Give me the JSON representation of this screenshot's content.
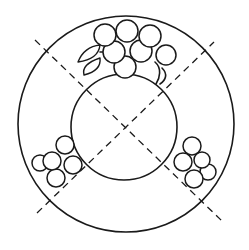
{
  "diagram": {
    "colors": {
      "line": "#1a1a1a",
      "background": "#ffffff"
    },
    "outer_circle": {
      "cx": 126,
      "cy": 124,
      "r": 108
    },
    "inner_circle": {
      "cx": 124,
      "cy": 127,
      "r": 53
    },
    "guide_lines": [
      {
        "x1": 35,
        "y1": 40,
        "x2": 222,
        "y2": 221
      },
      {
        "x1": 37,
        "y1": 213,
        "x2": 214,
        "y2": 42
      }
    ],
    "clusters": [
      {
        "name": "top-grape-cluster",
        "grapes": [
          {
            "cx": 105,
            "cy": 35,
            "r": 11
          },
          {
            "cx": 127,
            "cy": 31,
            "r": 11
          },
          {
            "cx": 150,
            "cy": 36,
            "r": 11
          },
          {
            "cx": 114,
            "cy": 53,
            "r": 11
          },
          {
            "cx": 139,
            "cy": 52,
            "r": 11
          },
          {
            "cx": 166,
            "cy": 55,
            "r": 10
          },
          {
            "cx": 125,
            "cy": 68,
            "r": 11
          }
        ],
        "leaves": 2
      },
      {
        "name": "left-grape-cluster",
        "grapes": [
          {
            "cx": 65,
            "cy": 145,
            "r": 9
          },
          {
            "cx": 40,
            "cy": 163,
            "r": 8
          },
          {
            "cx": 52,
            "cy": 162,
            "r": 9
          },
          {
            "cx": 73,
            "cy": 165,
            "r": 9
          },
          {
            "cx": 55,
            "cy": 178,
            "r": 9
          }
        ]
      },
      {
        "name": "right-grape-cluster",
        "grapes": [
          {
            "cx": 192,
            "cy": 146,
            "r": 9
          },
          {
            "cx": 202,
            "cy": 160,
            "r": 8
          },
          {
            "cx": 183,
            "cy": 162,
            "r": 9
          },
          {
            "cx": 208,
            "cy": 172,
            "r": 8
          },
          {
            "cx": 194,
            "cy": 179,
            "r": 9
          }
        ]
      }
    ]
  }
}
